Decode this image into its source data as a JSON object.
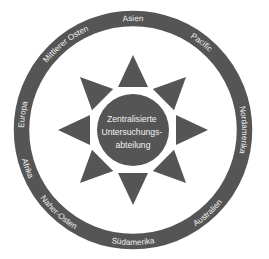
{
  "diagram": {
    "center": {
      "lines": [
        "Zentralisierte",
        "Untersuchungs-",
        "abteilung"
      ]
    },
    "regions": [
      {
        "id": "asien",
        "label": "Asien",
        "angle": 0
      },
      {
        "id": "pacific",
        "label": "Pacific",
        "angle": 38
      },
      {
        "id": "nordamerika",
        "label": "Nordamerika",
        "angle": 90
      },
      {
        "id": "australien",
        "label": "Australien",
        "angle": 138
      },
      {
        "id": "suedamerika",
        "label": "Südamerika",
        "angle": 180
      },
      {
        "id": "naher-osten",
        "label": "Naher-Osten",
        "angle": 222
      },
      {
        "id": "afrika",
        "label": "Afrika",
        "angle": 250
      },
      {
        "id": "europa",
        "label": "Europa",
        "angle": 278
      },
      {
        "id": "mittlerer-osten",
        "label": "Mittlerer Osten",
        "angle": 322
      }
    ],
    "rays": 8,
    "colors": {
      "fill": "#555555",
      "text": "#f2f2f2",
      "background": "#ffffff"
    }
  }
}
